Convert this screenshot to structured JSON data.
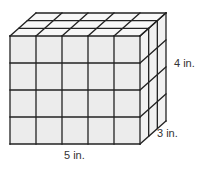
{
  "figure": {
    "type": "rectangular-prism-of-unit-cubes",
    "cubes": {
      "length": 5,
      "height": 4,
      "depth": 3
    },
    "labels": {
      "length": "5 in.",
      "height": "4 in.",
      "depth": "3 in."
    },
    "colors": {
      "front_face": "#ececec",
      "top_face": "#f7f7f7",
      "side_face": "#f1f1f1",
      "edge": "#222222"
    }
  }
}
